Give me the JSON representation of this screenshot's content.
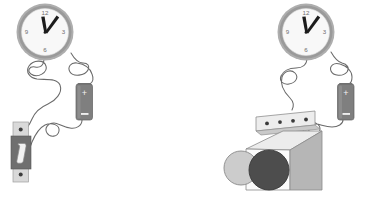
{
  "figure": {
    "background_color": "#ffffff",
    "panels": [
      {
        "id": "left-panel",
        "name": "clock-battery-switch-circuit",
        "components": [
          "wall-clock",
          "battery",
          "knife-switch",
          "connecting-wires"
        ]
      },
      {
        "id": "right-panel",
        "name": "clock-battery-buzzer-circuit",
        "components": [
          "wall-clock",
          "battery",
          "buzzer-box",
          "connecting-wires"
        ]
      }
    ]
  },
  "clock": {
    "name": "analog-wall-clock",
    "numerals": [
      "12",
      "3",
      "6",
      "9"
    ],
    "numeral_12": "12",
    "numeral_3": "3",
    "numeral_6": "6",
    "numeral_9": "9",
    "time_reading": "12:05",
    "rim_color": "#9a9a9a",
    "face_color": "#f7f7f7",
    "hand_color": "#1a1a1a"
  },
  "battery": {
    "name": "dry-cell-battery",
    "positive_label": "+",
    "negative_label": "–",
    "body_color": "#7c7c7c",
    "terminal_color": "#6a6a6a"
  },
  "switch": {
    "name": "knife-switch",
    "plate_color": "#d8d8d8",
    "block_color": "#6f6f6f",
    "lever_color": "#efefef",
    "screw_count": 2
  },
  "buzzer_box": {
    "name": "buzzer-device-box",
    "top_color": "#ededed",
    "front_color": "#fafafa",
    "side_color": "#b4b4b4",
    "terminal_strip_color": "#e8e8e8",
    "terminal_count": 4,
    "small_circle_color": "#c9c9c9",
    "large_circle_color": "#4a4a4a"
  },
  "wires": {
    "name": "connecting-wires",
    "color": "#6a6a6a",
    "style": "curly"
  }
}
